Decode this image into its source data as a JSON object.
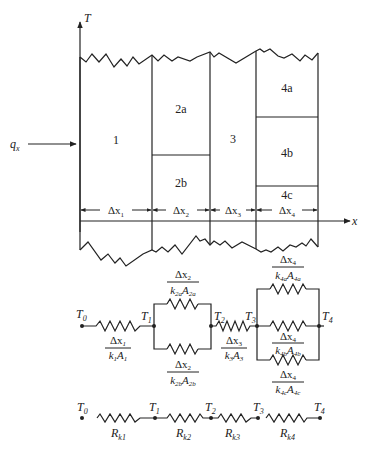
{
  "wall": {
    "axis_y_label": "T",
    "axis_x_label": "x",
    "heat_flux_label": "q",
    "heat_flux_sub": "x",
    "sections": [
      {
        "id": "1",
        "label": "1"
      },
      {
        "id": "2a",
        "label": "2a"
      },
      {
        "id": "2b",
        "label": "2b"
      },
      {
        "id": "3",
        "label": "3"
      },
      {
        "id": "4a",
        "label": "4a"
      },
      {
        "id": "4b",
        "label": "4b"
      },
      {
        "id": "4c",
        "label": "4c"
      }
    ],
    "dimensions": [
      {
        "delta": "Δx",
        "sub": "1"
      },
      {
        "delta": "Δx",
        "sub": "2"
      },
      {
        "delta": "Δx",
        "sub": "3"
      },
      {
        "delta": "Δx",
        "sub": "4"
      }
    ]
  },
  "circuit_parallel": {
    "nodes": [
      {
        "label": "T",
        "sub": "0"
      },
      {
        "label": "T",
        "sub": "1"
      },
      {
        "label": "T",
        "sub": "2"
      },
      {
        "label": "T",
        "sub": "3"
      },
      {
        "label": "T",
        "sub": "4"
      }
    ],
    "resistors": {
      "r1": {
        "num": "Δx",
        "num_sub": "1",
        "den_k": "k",
        "den_k_sub": "1",
        "den_a": "A",
        "den_a_sub": "1"
      },
      "r2a": {
        "num": "Δx",
        "num_sub": "2",
        "den_k": "k",
        "den_k_sub": "2a",
        "den_a": "A",
        "den_a_sub": "2a"
      },
      "r2b": {
        "num": "Δx",
        "num_sub": "2",
        "den_k": "k",
        "den_k_sub": "2b",
        "den_a": "A",
        "den_a_sub": "2b"
      },
      "r3": {
        "num": "Δx",
        "num_sub": "3",
        "den_k": "k",
        "den_k_sub": "3",
        "den_a": "A",
        "den_a_sub": "3"
      },
      "r4a": {
        "num": "Δx",
        "num_sub": "4",
        "den_k": "k",
        "den_k_sub": "4a",
        "den_a": "A",
        "den_a_sub": "4a"
      },
      "r4b": {
        "num": "Δx",
        "num_sub": "4",
        "den_k": "k",
        "den_k_sub": "4b",
        "den_a": "A",
        "den_a_sub": "4b"
      },
      "r4c": {
        "num": "Δx",
        "num_sub": "4",
        "den_k": "k",
        "den_k_sub": "4c",
        "den_a": "A",
        "den_a_sub": "4c"
      }
    }
  },
  "circuit_series": {
    "nodes": [
      {
        "label": "T",
        "sub": "0"
      },
      {
        "label": "T",
        "sub": "1"
      },
      {
        "label": "T",
        "sub": "2"
      },
      {
        "label": "T",
        "sub": "3"
      },
      {
        "label": "T",
        "sub": "4"
      }
    ],
    "resistors": [
      {
        "label": "R",
        "sub": "k1"
      },
      {
        "label": "R",
        "sub": "k2"
      },
      {
        "label": "R",
        "sub": "k3"
      },
      {
        "label": "R",
        "sub": "k4"
      }
    ]
  }
}
